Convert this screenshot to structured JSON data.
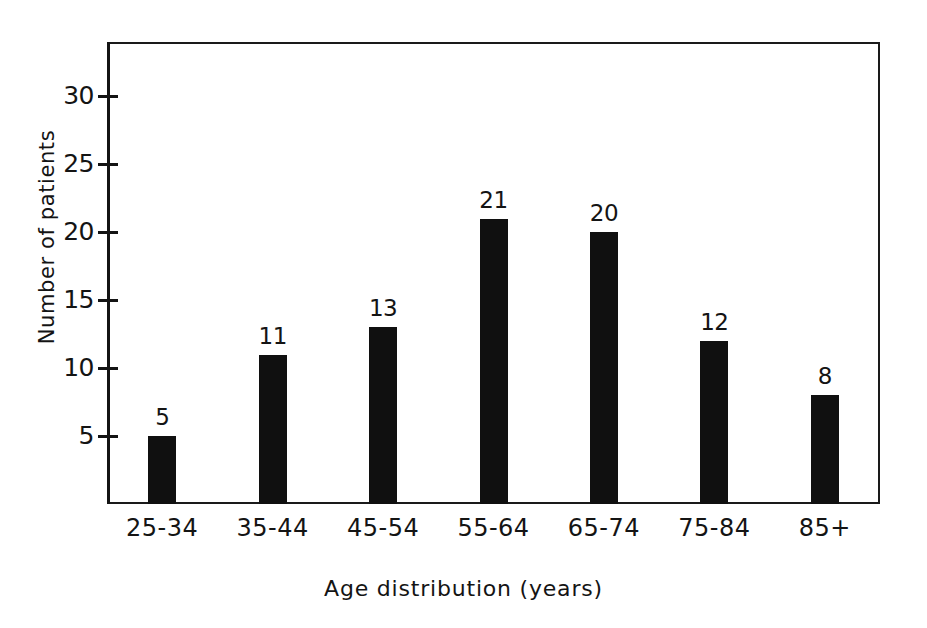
{
  "chart_data": {
    "type": "bar",
    "title": "",
    "xlabel": "Age distribution (years)",
    "ylabel": "Number of patients",
    "categories": [
      "25-34",
      "35-44",
      "45-54",
      "55-64",
      "65-74",
      "75-84",
      "85+"
    ],
    "values": [
      5,
      11,
      13,
      21,
      20,
      12,
      8
    ],
    "value_labels": [
      "5",
      "11",
      "13",
      "21",
      "20",
      "12",
      "8"
    ],
    "ylim": [
      0,
      34
    ],
    "yticks": [
      5,
      10,
      15,
      20,
      25,
      30
    ],
    "ytick_labels": [
      "5",
      "10",
      "15",
      "20",
      "25",
      "30"
    ],
    "grid": false,
    "legend": false,
    "bar_color": "#101010",
    "axis_color": "#141414",
    "background": "#ffffff"
  }
}
